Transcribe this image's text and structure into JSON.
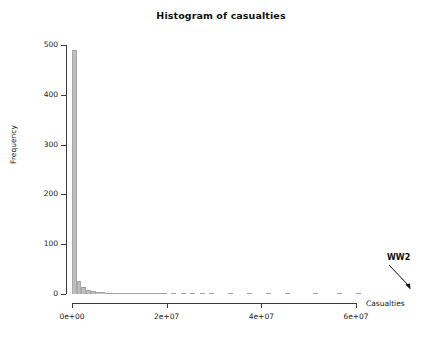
{
  "chart_data": {
    "type": "bar",
    "title": "Histogram of casualties",
    "xlabel": "Casualties",
    "ylabel": "Frequency",
    "xlim": [
      0,
      62000000
    ],
    "ylim": [
      0,
      500
    ],
    "grid": false,
    "legend": null,
    "bin_width": 1000000,
    "x_tick_labels": [
      "0e+00",
      "2e+07",
      "4e+07",
      "6e+07"
    ],
    "x_tick_values": [
      0,
      20000000,
      40000000,
      60000000
    ],
    "y_tick_labels": [
      "0",
      "100",
      "200",
      "300",
      "400",
      "500"
    ],
    "y_tick_values": [
      0,
      100,
      200,
      300,
      400,
      500
    ],
    "bar_color": "#bdbdbd",
    "bar_edge_color": "#a0a0a0",
    "x": [
      500000,
      1500000,
      2500000,
      3500000,
      4500000,
      5500000,
      6500000,
      7500000,
      8500000,
      9500000,
      10500000,
      11500000,
      12500000,
      13500000,
      14500000,
      15500000,
      16500000,
      17500000,
      18500000,
      19500000,
      21500000,
      23500000,
      25500000,
      27500000,
      29500000,
      33500000,
      37500000,
      41500000,
      45500000,
      51500000,
      56500000,
      60500000
    ],
    "values": [
      490,
      27,
      14,
      9,
      7,
      5,
      4,
      3,
      3,
      2,
      2,
      2,
      2,
      1,
      1,
      2,
      1,
      1,
      1,
      1,
      1,
      1,
      1,
      1,
      1,
      1,
      1,
      1,
      1,
      1,
      1,
      1
    ],
    "annotations": [
      {
        "text": "WW2",
        "points_to_x": 60500000,
        "points_to_y": 1,
        "arrow": true
      }
    ]
  },
  "axes": {
    "y_ticks": [
      {
        "label": "500",
        "value": 500
      },
      {
        "label": "400",
        "value": 400
      },
      {
        "label": "300",
        "value": 300
      },
      {
        "label": "200",
        "value": 200
      },
      {
        "label": "100",
        "value": 100
      },
      {
        "label": "0",
        "value": 0
      }
    ],
    "x_ticks": [
      {
        "label": "0e+00",
        "value": 0
      },
      {
        "label": "2e+07",
        "value": 20000000
      },
      {
        "label": "4e+07",
        "value": 40000000
      },
      {
        "label": "6e+07",
        "value": 60000000
      }
    ]
  }
}
